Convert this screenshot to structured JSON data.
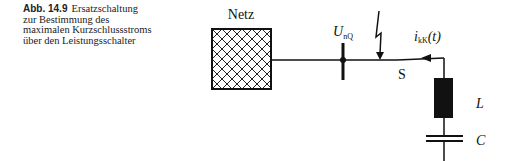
{
  "figure": {
    "number": "Abb. 14.9",
    "caption_lines": [
      "Ersatzschaltung",
      "zur Bestimmung des",
      "maximalen Kurzschlussstroms",
      "über den Leistungsschalter"
    ]
  },
  "diagram": {
    "source_label": "Netz",
    "busbar_label_main": "U",
    "busbar_label_sub": "nQ",
    "switch_label": "S",
    "current_label_main": "i",
    "current_label_sub": "kK",
    "current_label_suffix": "(t)",
    "inductor_label": "L",
    "capacitor_label": "C"
  }
}
